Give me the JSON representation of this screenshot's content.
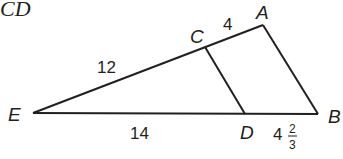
{
  "title": "CD",
  "points": {
    "A": {
      "label": "A"
    },
    "B": {
      "label": "B"
    },
    "C": {
      "label": "C"
    },
    "D": {
      "label": "D"
    },
    "E": {
      "label": "E"
    }
  },
  "segments": {
    "EC": "12",
    "CA": "4",
    "ED": "14",
    "DB_whole": "4",
    "DB_num": "2",
    "DB_den": "3"
  },
  "colors": {
    "stroke": "#231f20",
    "background": "#ffffff"
  }
}
